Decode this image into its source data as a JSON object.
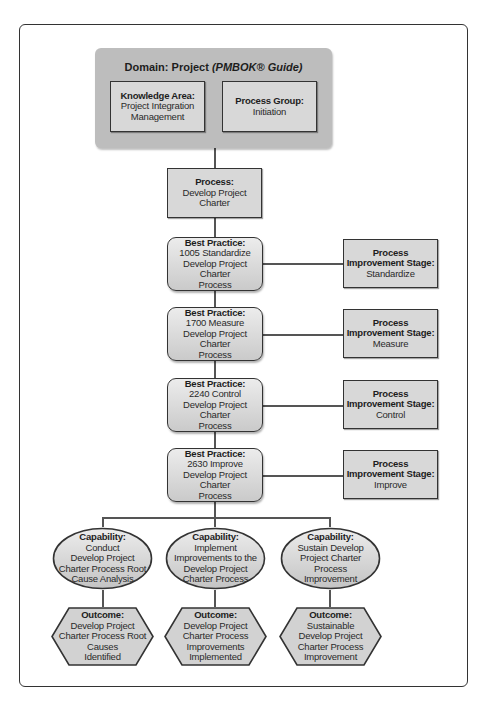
{
  "domain": {
    "title_prefix": "Domain: Project ",
    "title_italic": "(PMBOK® Guide)",
    "knowledge_area": {
      "label": "Knowledge Area:",
      "lines": [
        "Project Integration",
        "Management"
      ]
    },
    "process_group": {
      "label": "Process Group:",
      "lines": [
        "Initiation"
      ]
    }
  },
  "process": {
    "label": "Process:",
    "lines": [
      "Develop Project",
      "Charter"
    ]
  },
  "best_practices": [
    {
      "label": "Best Practice:",
      "lines": [
        "1005 Standardize",
        "Develop Project Charter",
        "Process"
      ]
    },
    {
      "label": "Best Practice:",
      "lines": [
        "1700 Measure",
        "Develop Project Charter",
        "Process"
      ]
    },
    {
      "label": "Best Practice:",
      "lines": [
        "2240 Control",
        "Develop Project Charter",
        "Process"
      ]
    },
    {
      "label": "Best Practice:",
      "lines": [
        "2630 Improve",
        "Develop Project Charter",
        "Process"
      ]
    }
  ],
  "stages": [
    {
      "label1": "Process",
      "label2": "Improvement Stage:",
      "value": "Standardize"
    },
    {
      "label1": "Process",
      "label2": "Improvement Stage:",
      "value": "Measure"
    },
    {
      "label1": "Process",
      "label2": "Improvement Stage:",
      "value": "Control"
    },
    {
      "label1": "Process",
      "label2": "Improvement Stage:",
      "value": "Improve"
    }
  ],
  "capabilities": [
    {
      "label": "Capability:",
      "lines": [
        "Conduct",
        "Develop Project",
        "Charter Process Root",
        "Cause Analysis"
      ]
    },
    {
      "label": "Capability:",
      "lines": [
        "Implement",
        "Improvements to the",
        "Develop Project",
        "Charter Process"
      ]
    },
    {
      "label": "Capability:",
      "lines": [
        "Sustain Develop",
        "Project Charter",
        "Process",
        "Improvement"
      ]
    }
  ],
  "outcomes": [
    {
      "label": "Outcome:",
      "lines": [
        "Develop Project",
        "Charter Process Root",
        "Causes",
        "Identified"
      ]
    },
    {
      "label": "Outcome:",
      "lines": [
        "Develop Project",
        "Charter Process",
        "Improvements",
        "Implemented"
      ]
    },
    {
      "label": "Outcome:",
      "lines": [
        "Sustainable",
        "Develop Project",
        "Charter Process",
        "Improvement"
      ]
    }
  ],
  "colors": {
    "box_fill": "#d8d8d8",
    "domain_fill": "#bdbdbd",
    "stroke": "#333333"
  }
}
